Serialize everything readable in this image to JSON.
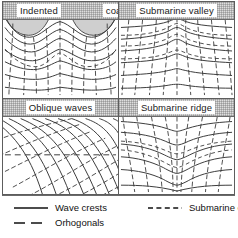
{
  "figure": {
    "kind": "wave-refraction-diagram",
    "panel_order": [
      "top_left",
      "top_right",
      "bottom_left",
      "bottom_right"
    ],
    "colors": {
      "line": "#3a3a3a",
      "land_fill": "#cfcfcf",
      "title_band": "#dedede",
      "panel_border": "#5d5d5d",
      "frame_border": "#b9b9b9",
      "text": "#1a1a1a",
      "page_background": "#ffffff"
    }
  },
  "panels": {
    "top_left": {
      "title_parts": [
        "Indented",
        "coast"
      ],
      "full_title": "Indented coast",
      "features": [
        "headland",
        "bay",
        "wave-crests",
        "orthogonals",
        "submarine-contours"
      ]
    },
    "top_right": {
      "title": "Submarine valley",
      "features": [
        "wave-crests",
        "orthogonals",
        "submarine-contours",
        "divergence"
      ]
    },
    "bottom_left": {
      "title": "Oblique waves",
      "features": [
        "wave-crests",
        "orthogonals",
        "submarine-contour",
        "oblique-approach"
      ]
    },
    "bottom_right": {
      "title": "Submarine ridge",
      "features": [
        "wave-crests",
        "orthogonals",
        "submarine-contours",
        "convergence"
      ]
    }
  },
  "legend": {
    "items": [
      {
        "label": "Wave crests",
        "style": "solid",
        "icon": "solid-line-icon"
      },
      {
        "label": "Submarine contours",
        "style": "dashed",
        "icon": "dashed-line-icon"
      },
      {
        "label": "Orhogonals",
        "style": "dash-dash",
        "icon": "long-dash-line-icon"
      }
    ]
  }
}
